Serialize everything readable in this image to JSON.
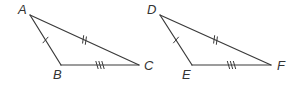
{
  "diagram": {
    "line_color": "#3a3a3a",
    "label_color": "#333333",
    "triangles": [
      {
        "name": "ABC",
        "vertices": [
          "A",
          "B",
          "C"
        ],
        "sides": [
          {
            "from": "A",
            "to": "B",
            "ticks": 1
          },
          {
            "from": "A",
            "to": "C",
            "ticks": 2
          },
          {
            "from": "B",
            "to": "C",
            "ticks": 3
          }
        ]
      },
      {
        "name": "DEF",
        "vertices": [
          "D",
          "E",
          "F"
        ],
        "sides": [
          {
            "from": "D",
            "to": "E",
            "ticks": 1
          },
          {
            "from": "D",
            "to": "F",
            "ticks": 2
          },
          {
            "from": "E",
            "to": "F",
            "ticks": 3
          }
        ]
      }
    ]
  }
}
